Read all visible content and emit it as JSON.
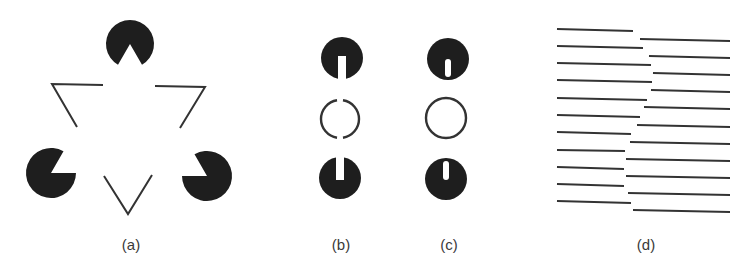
{
  "figure": {
    "width": 749,
    "height": 273,
    "ink_color": "#1e1e1e",
    "stroke_color": "#333333",
    "background": "#ffffff",
    "panels": [
      {
        "id": "a",
        "label": "(a)",
        "label_x": 131,
        "description": "Kanizsa illusory triangle",
        "pacmen": [
          {
            "cx": 130,
            "cy": 44,
            "r": 24,
            "mouth_start_deg": 240,
            "mouth_end_deg": 300
          },
          {
            "cx": 51,
            "cy": 173,
            "r": 25,
            "mouth_start_deg": 0,
            "mouth_end_deg": 60
          },
          {
            "cx": 207,
            "cy": 176,
            "r": 25,
            "mouth_start_deg": 120,
            "mouth_end_deg": 180
          }
        ],
        "outline_corners": [
          {
            "points": [
              [
                103,
                85
              ],
              [
                52,
                84
              ],
              [
                77,
                127
              ]
            ]
          },
          {
            "points": [
              [
                155,
                86
              ],
              [
                205,
                87
              ],
              [
                180,
                128
              ]
            ]
          },
          {
            "points": [
              [
                104,
                176
              ],
              [
                128,
                214
              ],
              [
                152,
                175
              ]
            ]
          }
        ]
      },
      {
        "id": "b",
        "label": "(b)",
        "label_x": 341,
        "description": "Slotted disks with broken circle",
        "top_disk": {
          "cx": 342,
          "cy": 58,
          "r": 21,
          "slot_width": 8,
          "slot_from": "bottom",
          "slot_to_y": 56
        },
        "ring": {
          "cx": 340,
          "cy": 119,
          "r": 19,
          "gap_deg": 18
        },
        "bottom_disk": {
          "cx": 340,
          "cy": 178,
          "r": 21,
          "slot_width": 8,
          "slot_from": "top",
          "slot_to_y": 180
        }
      },
      {
        "id": "c",
        "label": "(c)",
        "label_x": 449,
        "description": "Disks with enclosed slits and full circle",
        "top_disk": {
          "cx": 448,
          "cy": 59,
          "r": 21,
          "slit_width": 6,
          "slit_y1": 59,
          "slit_y2": 77
        },
        "ring": {
          "cx": 446,
          "cy": 118,
          "r": 20
        },
        "bottom_disk": {
          "cx": 446,
          "cy": 179,
          "r": 21,
          "slit_width": 6,
          "slit_y1": 161,
          "slit_y2": 180
        }
      },
      {
        "id": "d",
        "label": "(d)",
        "label_x": 646,
        "description": "Offset line gratings producing illusory contour",
        "lines": [
          {
            "x1": 557,
            "y1": 29,
            "x2": 633,
            "y2": 31
          },
          {
            "x1": 640,
            "y1": 39,
            "x2": 730,
            "y2": 41
          },
          {
            "x1": 557,
            "y1": 46,
            "x2": 643,
            "y2": 48
          },
          {
            "x1": 649,
            "y1": 56,
            "x2": 730,
            "y2": 58
          },
          {
            "x1": 557,
            "y1": 63,
            "x2": 651,
            "y2": 65
          },
          {
            "x1": 653,
            "y1": 73,
            "x2": 730,
            "y2": 75
          },
          {
            "x1": 557,
            "y1": 80,
            "x2": 652,
            "y2": 82
          },
          {
            "x1": 651,
            "y1": 90,
            "x2": 730,
            "y2": 92
          },
          {
            "x1": 557,
            "y1": 98,
            "x2": 647,
            "y2": 100
          },
          {
            "x1": 644,
            "y1": 107,
            "x2": 730,
            "y2": 109
          },
          {
            "x1": 557,
            "y1": 115,
            "x2": 640,
            "y2": 117
          },
          {
            "x1": 637,
            "y1": 125,
            "x2": 730,
            "y2": 127
          },
          {
            "x1": 557,
            "y1": 132,
            "x2": 631,
            "y2": 134
          },
          {
            "x1": 630,
            "y1": 142,
            "x2": 730,
            "y2": 144
          },
          {
            "x1": 557,
            "y1": 150,
            "x2": 625,
            "y2": 151
          },
          {
            "x1": 626,
            "y1": 159,
            "x2": 730,
            "y2": 161
          },
          {
            "x1": 557,
            "y1": 167,
            "x2": 624,
            "y2": 169
          },
          {
            "x1": 626,
            "y1": 176,
            "x2": 730,
            "y2": 178
          },
          {
            "x1": 557,
            "y1": 184,
            "x2": 624,
            "y2": 186
          },
          {
            "x1": 628,
            "y1": 193,
            "x2": 730,
            "y2": 195
          },
          {
            "x1": 557,
            "y1": 201,
            "x2": 631,
            "y2": 203
          },
          {
            "x1": 633,
            "y1": 210,
            "x2": 730,
            "y2": 212
          }
        ]
      }
    ]
  }
}
